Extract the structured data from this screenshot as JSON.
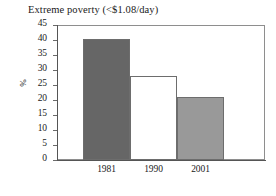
{
  "chart_data": {
    "type": "bar",
    "title": "Extreme poverty (<$1.08/day)",
    "xlabel": "",
    "ylabel": "%",
    "categories": [
      "1981",
      "1990",
      "2001"
    ],
    "values": [
      40.5,
      28.0,
      21.0
    ],
    "ylim": [
      0,
      45
    ],
    "ytick_step": 5,
    "yticks": [
      "45",
      "40",
      "35",
      "30",
      "25",
      "20",
      "15",
      "10",
      "5",
      "0"
    ],
    "ytick_values": [
      45,
      40,
      35,
      30,
      25,
      20,
      15,
      10,
      5,
      0
    ],
    "grid": false,
    "legend": null,
    "series": [
      {
        "name": "Extreme poverty",
        "values": [
          40.5,
          28.0,
          21.0
        ],
        "bar_colors": [
          "#666666",
          "#ffffff",
          "#999999"
        ],
        "bar_edge_color": "#6d6d6d"
      }
    ],
    "bar_style": "adjacent",
    "frame_color": "#8e8e8e",
    "axis_color": "#555555"
  }
}
